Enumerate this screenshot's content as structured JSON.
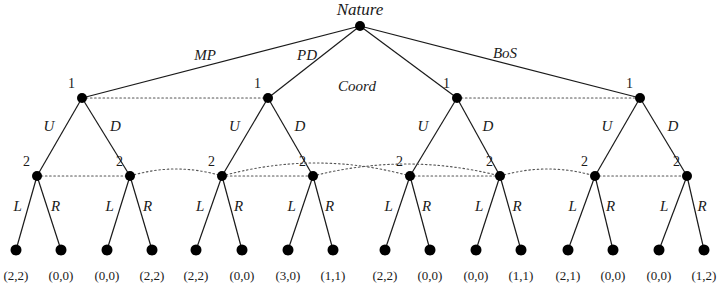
{
  "figure": {
    "type": "game-tree",
    "root": {
      "label": "Nature",
      "x": 360,
      "y": 26
    },
    "nature_branches": [
      {
        "label": "MP",
        "x": 205,
        "y": 47
      },
      {
        "label": "PD",
        "x": 307,
        "y": 47
      },
      {
        "label": "Coord",
        "x": 357,
        "y": 78
      },
      {
        "label": "BoS",
        "x": 505,
        "y": 45
      }
    ],
    "player1_label": "1",
    "player2_label": "2",
    "action_up": "U",
    "action_down": "D",
    "action_left": "L",
    "action_right": "R",
    "subgames": [
      {
        "name": "MP",
        "p1_x": 82,
        "n2_left_x": 37,
        "n2_right_x": 130
      },
      {
        "name": "PD",
        "p1_x": 268,
        "n2_left_x": 222,
        "n2_right_x": 313
      },
      {
        "name": "Coord",
        "p1_x": 457,
        "n2_left_x": 410,
        "n2_right_x": 500
      },
      {
        "name": "BoS",
        "p1_x": 640,
        "n2_left_x": 595,
        "n2_right_x": 687
      }
    ],
    "levels": {
      "p1_y": 98,
      "p2_y": 176,
      "terminal_y": 250
    },
    "terminals": [
      {
        "x": 16,
        "payoff": "(2,2)"
      },
      {
        "x": 61,
        "payoff": "(0,0)"
      },
      {
        "x": 107,
        "payoff": "(0,0)"
      },
      {
        "x": 152,
        "payoff": "(2,2)"
      },
      {
        "x": 196,
        "payoff": "(2,2)"
      },
      {
        "x": 242,
        "payoff": "(0,0)"
      },
      {
        "x": 288,
        "payoff": "(3,0)"
      },
      {
        "x": 333,
        "payoff": "(1,1)"
      },
      {
        "x": 385,
        "payoff": "(2,2)"
      },
      {
        "x": 430,
        "payoff": "(0,0)"
      },
      {
        "x": 476,
        "payoff": "(0,0)"
      },
      {
        "x": 521,
        "payoff": "(1,1)"
      },
      {
        "x": 568,
        "payoff": "(2,1)"
      },
      {
        "x": 613,
        "payoff": "(0,0)"
      },
      {
        "x": 659,
        "payoff": "(0,0)"
      },
      {
        "x": 704,
        "payoff": "(1,2)"
      }
    ],
    "colors": {
      "ink": "#1a1a1a",
      "node": "#000000",
      "dotted": "#555555"
    }
  }
}
